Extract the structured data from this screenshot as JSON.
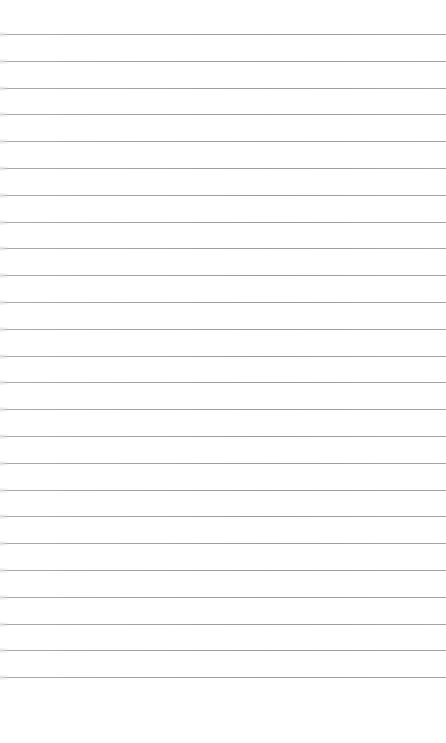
{
  "page": {
    "type": "lined-paper",
    "background_color": "#ffffff",
    "rule_color": "#9c9c9c",
    "rule_count": 25,
    "first_rule_y": 34,
    "rule_spacing": 26.8
  }
}
